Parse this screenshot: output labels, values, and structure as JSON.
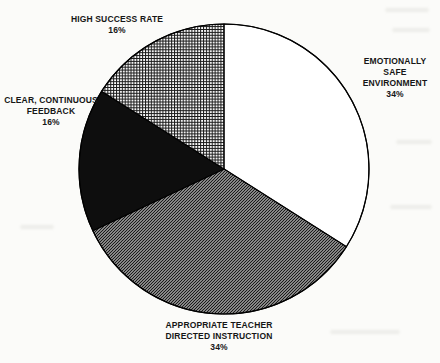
{
  "chart_data": {
    "type": "pie",
    "start_angle_deg": 0,
    "direction": "clockwise",
    "slices": [
      {
        "label": "EMOTIONALLY SAFE ENVIRONMENT",
        "value_pct": 34,
        "fill": "white"
      },
      {
        "label": "APPROPRIATE TEACHER DIRECTED INSTRUCTION",
        "value_pct": 34,
        "fill": "diagonal-hatch"
      },
      {
        "label": "CLEAR, CONTINUOUS FEEDBACK",
        "value_pct": 16,
        "fill": "solid-black"
      },
      {
        "label": "HIGH SUCCESS RATE",
        "value_pct": 16,
        "fill": "cross-hatch"
      }
    ]
  },
  "labels": {
    "high_success_rate": {
      "text": "HIGH SUCCESS RATE\n16%"
    },
    "emotionally_safe": {
      "text": "EMOTIONALLY SAFE\nENVIRONMENT\n34%"
    },
    "clear_feedback": {
      "text": "CLEAR, CONTINUOUS\nFEEDBACK\n16%"
    },
    "teacher_instruction": {
      "text": "APPROPRIATE TEACHER\nDIRECTED INSTRUCTION\n34%"
    }
  },
  "colors": {
    "ink": "#161616",
    "paper": "#fbfbf9",
    "slice_black": "#0e0e0e",
    "slice_white": "#ffffff"
  }
}
